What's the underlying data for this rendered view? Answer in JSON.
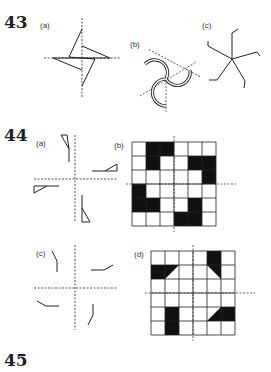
{
  "questions": [
    {
      "number": "43",
      "parts": [
        {
          "label": "(a)"
        },
        {
          "label": "(b)"
        },
        {
          "label": "(c)"
        }
      ]
    },
    {
      "number": "44",
      "parts": [
        {
          "label": "(a)"
        },
        {
          "label": "(b)"
        },
        {
          "label": "(c)"
        },
        {
          "label": "(d)"
        }
      ]
    },
    {
      "number": "45",
      "parts": []
    }
  ],
  "grid_b": {
    "rows": 6,
    "cols": 6,
    "black_cells": [
      [
        0,
        1
      ],
      [
        0,
        2
      ],
      [
        1,
        1
      ],
      [
        1,
        4
      ],
      [
        1,
        5
      ],
      [
        2,
        5
      ],
      [
        3,
        0
      ],
      [
        4,
        0
      ],
      [
        4,
        1
      ],
      [
        4,
        4
      ],
      [
        5,
        3
      ],
      [
        5,
        4
      ]
    ]
  },
  "grid_d": {
    "rows": 6,
    "cols": 6,
    "black_cells": [
      [
        0,
        4
      ],
      [
        1,
        0
      ],
      [
        4,
        1
      ],
      [
        5,
        1
      ],
      [
        4,
        5
      ]
    ],
    "half_cells": [
      [
        1,
        1,
        "upper-left"
      ],
      [
        1,
        4,
        "upper-right"
      ],
      [
        4,
        1,
        "upper-right-diag"
      ],
      [
        4,
        4,
        "lower-right"
      ]
    ]
  },
  "colors": {
    "ink": "#222222",
    "fill": "#111111"
  }
}
